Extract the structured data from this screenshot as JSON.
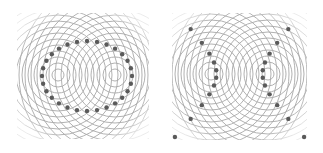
{
  "figure": {
    "colors": {
      "background": "#ffffff",
      "ring_stroke": "#a8a8a8",
      "dot_fill": "#5a5a5a"
    },
    "panels": [
      {
        "id": "ellipse",
        "label": "Sum of distances constant (ellipse)",
        "box": {
          "x": 17,
          "y": 13,
          "w": 132,
          "h": 126
        },
        "sources": [
          [
            58,
            75
          ],
          [
            115,
            75
          ]
        ],
        "ring_spacing": 6,
        "ring_count": 16,
        "curve": {
          "type": "ellipse",
          "cx": 87,
          "cy": 76,
          "rx": 45,
          "ry": 35,
          "dot_count": 28
        }
      },
      {
        "id": "hyperbola",
        "label": "Difference of distances constant (hyperbola)",
        "box": {
          "x": 172,
          "y": 13,
          "w": 135,
          "h": 127
        },
        "sources": [
          [
            211,
            74
          ],
          [
            268,
            74
          ]
        ],
        "ring_spacing": 6,
        "ring_count": 16,
        "curve": {
          "type": "hyperbola",
          "cx": 239.5,
          "cy": 74,
          "a": 23,
          "b": 24,
          "dot_count_per_branch": 14
        }
      }
    ]
  }
}
